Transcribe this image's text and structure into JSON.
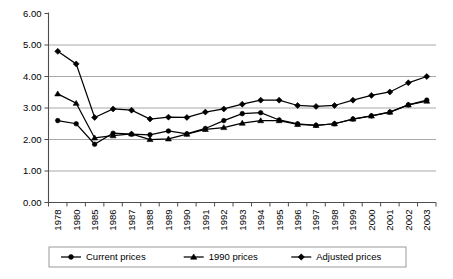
{
  "chart_data": {
    "type": "line",
    "title": "",
    "subtitle": "",
    "xlabel": "",
    "ylabel": "",
    "ylim": [
      0.0,
      6.0
    ],
    "ytick_step": 1.0,
    "ytick_labels": [
      "0.00",
      "1.00",
      "2.00",
      "3.00",
      "4.00",
      "5.00",
      "6.00"
    ],
    "ytick_values": [
      0.0,
      1.0,
      2.0,
      3.0,
      4.0,
      5.0,
      6.0
    ],
    "grid": "horizontal-only, gridlines drawn at 1.00 through 5.00",
    "legend_position": "bottom-center",
    "categories": [
      "1978",
      "1980",
      "1985",
      "1986",
      "1987",
      "1988",
      "1989",
      "1990",
      "1991",
      "1992",
      "1993",
      "1994",
      "1995",
      "1996",
      "1997",
      "1998",
      "1999",
      "2000",
      "2001",
      "2002",
      "2003"
    ],
    "series": [
      {
        "name": "Current prices",
        "marker": "circle",
        "color": "#000000",
        "values": [
          2.6,
          2.5,
          1.85,
          2.2,
          2.17,
          2.15,
          2.27,
          2.18,
          2.35,
          2.6,
          2.82,
          2.85,
          2.62,
          2.5,
          2.45,
          2.5,
          2.65,
          2.75,
          2.87,
          3.1,
          3.25
        ]
      },
      {
        "name": "1990 prices",
        "marker": "triangle",
        "color": "#000000",
        "values": [
          3.45,
          3.15,
          2.05,
          2.12,
          2.18,
          2.0,
          2.02,
          2.17,
          2.32,
          2.38,
          2.52,
          2.6,
          2.6,
          2.48,
          2.45,
          2.5,
          2.65,
          2.75,
          2.87,
          3.1,
          3.22
        ]
      },
      {
        "name": "Adjusted prices",
        "marker": "diamond",
        "color": "#000000",
        "values": [
          4.8,
          4.4,
          2.7,
          2.97,
          2.93,
          2.65,
          2.71,
          2.7,
          2.87,
          2.97,
          3.12,
          3.25,
          3.25,
          3.08,
          3.05,
          3.08,
          3.25,
          3.4,
          3.51,
          3.8,
          4.0
        ]
      }
    ]
  },
  "legend": {
    "items": [
      {
        "label": "Current prices",
        "marker": "circle"
      },
      {
        "label": "1990 prices",
        "marker": "triangle"
      },
      {
        "label": "Adjusted prices",
        "marker": "diamond"
      }
    ]
  }
}
